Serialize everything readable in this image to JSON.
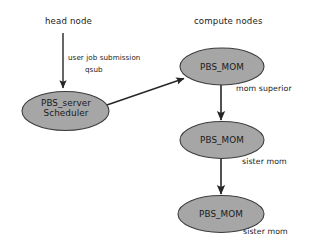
{
  "canvas": {
    "width": 309,
    "height": 247,
    "background": "#ffffff",
    "node_fill": "#a6a6a6",
    "node_stroke": "#3c3c3c",
    "edge_color": "#262626",
    "text_color": "#1a1a1a"
  },
  "groups": {
    "head_node": "head node",
    "compute_nodes": "compute nodes"
  },
  "nodes": {
    "pbs_server": {
      "line1": "PBS_server",
      "line2": "Scheduler"
    },
    "mom_superior": {
      "label": "PBS_MOM"
    },
    "sister_mom_1": {
      "label": "PBS_MOM"
    },
    "sister_mom_2": {
      "label": "PBS_MOM"
    }
  },
  "edges": {
    "submission_line1": "user job submission",
    "submission_line2": "qsub"
  },
  "annotations": {
    "mom_superior": "mom superior",
    "sister_mom_1": "sister mom",
    "sister_mom_2": "sister mom"
  }
}
